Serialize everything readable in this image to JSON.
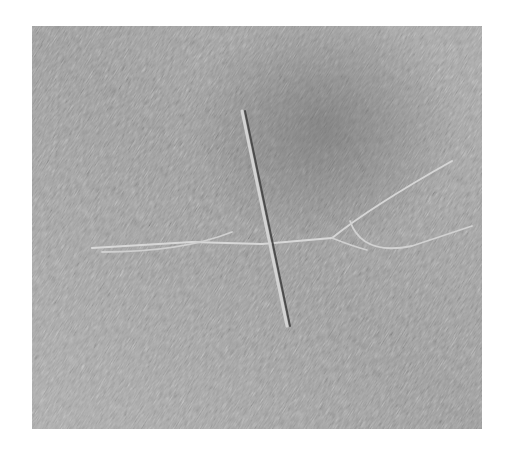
{
  "image": {
    "subject": "incised fish and cross carving on stone",
    "palette": {
      "page_background": "#ffffff",
      "stone_mid": "#9a9a9a",
      "stone_light": "#c4c4c4",
      "stone_dark": "#6e6e6e",
      "groove_highlight": "#d6d6d6",
      "groove_shadow": "#4a4a4a"
    },
    "frame": {
      "x": 32,
      "y": 26,
      "width": 450,
      "height": 403
    }
  }
}
